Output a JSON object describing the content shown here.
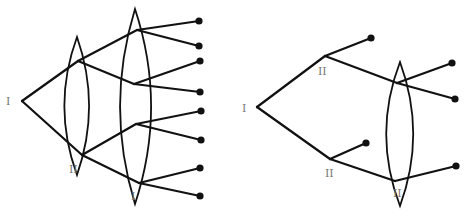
{
  "diagram": {
    "type": "extensive-form game trees",
    "colors": {
      "line": "#111111",
      "label": "#777777",
      "background": "#ffffff"
    },
    "trees": [
      {
        "name": "left-tree",
        "root": {
          "label": "I",
          "x": 22,
          "y": 101,
          "lx": 6,
          "ly": 105
        },
        "nodes": [
          {
            "id": "a",
            "x": 78,
            "y": 61
          },
          {
            "id": "b",
            "x": 82,
            "y": 155
          },
          {
            "id": "c",
            "x": 137,
            "y": 30
          },
          {
            "id": "d",
            "x": 134,
            "y": 84
          },
          {
            "id": "e",
            "x": 136,
            "y": 124
          },
          {
            "id": "f",
            "x": 139,
            "y": 183
          }
        ],
        "edges": [
          [
            22,
            101,
            78,
            61
          ],
          [
            22,
            101,
            82,
            155
          ],
          [
            78,
            61,
            137,
            30
          ],
          [
            78,
            61,
            134,
            84
          ],
          [
            82,
            155,
            136,
            124
          ],
          [
            82,
            155,
            139,
            183
          ],
          [
            137,
            30,
            199,
            21
          ],
          [
            137,
            30,
            199,
            46
          ],
          [
            134,
            84,
            200,
            61
          ],
          [
            134,
            84,
            200,
            92
          ],
          [
            136,
            124,
            201,
            111
          ],
          [
            136,
            124,
            201,
            140
          ],
          [
            139,
            183,
            200,
            168
          ],
          [
            139,
            183,
            200,
            196
          ]
        ],
        "leaves": [
          [
            199,
            21
          ],
          [
            199,
            46
          ],
          [
            200,
            61
          ],
          [
            200,
            92
          ],
          [
            201,
            111
          ],
          [
            201,
            140
          ],
          [
            200,
            168
          ],
          [
            200,
            196
          ]
        ],
        "information_sets": [
          {
            "label": "II",
            "top": [
              77,
              37
            ],
            "bottom": [
              77,
              175
            ],
            "left": 55,
            "right": 98,
            "lx": 69,
            "ly": 173
          },
          {
            "label": "I",
            "top": [
              135,
              9
            ],
            "bottom": [
              135,
              204
            ],
            "left": 109,
            "right": 163,
            "lx": 131,
            "ly": 200
          }
        ]
      },
      {
        "name": "right-tree",
        "root": {
          "label": "I",
          "x": 257,
          "y": 107,
          "lx": 242,
          "ly": 112
        },
        "nodes": [
          {
            "id": "a",
            "x": 325,
            "y": 56,
            "label": "II",
            "lx": 318,
            "ly": 75
          },
          {
            "id": "b",
            "x": 330,
            "y": 159,
            "label": "II",
            "lx": 325,
            "ly": 177
          },
          {
            "id": "c",
            "x": 397,
            "y": 83
          },
          {
            "id": "d",
            "x": 395,
            "y": 181
          }
        ],
        "edges": [
          [
            257,
            107,
            325,
            56
          ],
          [
            257,
            107,
            330,
            159
          ],
          [
            325,
            56,
            371,
            38
          ],
          [
            325,
            56,
            397,
            83
          ],
          [
            330,
            159,
            366,
            143
          ],
          [
            330,
            159,
            395,
            181
          ],
          [
            397,
            83,
            452,
            63
          ],
          [
            397,
            83,
            455,
            99
          ],
          [
            395,
            181,
            456,
            166
          ]
        ],
        "leaves": [
          [
            371,
            38
          ],
          [
            366,
            143
          ],
          [
            452,
            63
          ],
          [
            455,
            99
          ],
          [
            456,
            166
          ]
        ],
        "information_sets": [
          {
            "label": "II",
            "top": [
              400,
              62
            ],
            "bottom": [
              400,
              206
            ],
            "left": 376,
            "right": 423,
            "lx": 393,
            "ly": 197
          }
        ]
      }
    ]
  }
}
